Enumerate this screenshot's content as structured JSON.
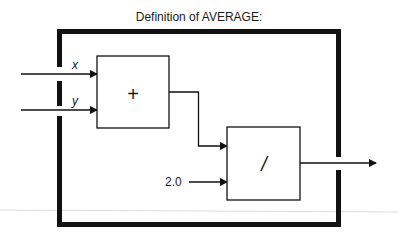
{
  "title": "Definition of AVERAGE:",
  "inputs": [
    {
      "label": "x"
    },
    {
      "label": "y"
    }
  ],
  "blocks": [
    {
      "name": "add",
      "symbol": "+"
    },
    {
      "name": "divide",
      "symbol": "/"
    }
  ],
  "constant": {
    "value": "2.0"
  },
  "colors": {
    "stroke": "#111111",
    "artifact": "#d8d8d8"
  }
}
